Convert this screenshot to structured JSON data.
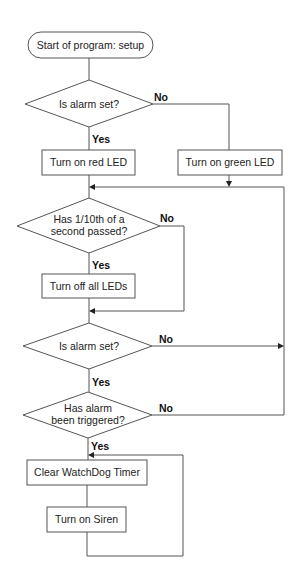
{
  "diagram": {
    "type": "flowchart",
    "colors": {
      "stroke": "#555555",
      "text": "#222222",
      "background": "#ffffff"
    },
    "nodes": {
      "start": {
        "shape": "terminal",
        "label": "Start of program: setup"
      },
      "decision_alarm_set_1": {
        "shape": "decision",
        "label": "Is alarm set?"
      },
      "red_led": {
        "shape": "process",
        "label": "Turn on red LED"
      },
      "green_led": {
        "shape": "process",
        "label": "Turn on green LED"
      },
      "decision_tenth_second": {
        "shape": "decision",
        "line1": "Has 1/10th of a",
        "line2": "second passed?"
      },
      "leds_off": {
        "shape": "process",
        "label": "Turn off all LEDs"
      },
      "decision_alarm_set_2": {
        "shape": "decision",
        "label": "Is alarm set?"
      },
      "decision_triggered": {
        "shape": "decision",
        "line1": "Has alarm",
        "line2": "been triggered?"
      },
      "clear_watchdog": {
        "shape": "process",
        "label": "Clear WatchDog Timer"
      },
      "siren_on": {
        "shape": "process",
        "label": "Turn on Siren"
      }
    },
    "edge_labels": {
      "alarm1_no": "No",
      "alarm1_yes": "Yes",
      "tenth_no": "No",
      "tenth_yes": "Yes",
      "alarm2_no": "No",
      "alarm2_yes": "Yes",
      "triggered_no": "No",
      "triggered_yes": "Yes"
    },
    "edges": [
      {
        "from": "start",
        "to": "decision_alarm_set_1"
      },
      {
        "from": "decision_alarm_set_1",
        "to": "red_led",
        "label": "Yes"
      },
      {
        "from": "decision_alarm_set_1",
        "to": "green_led",
        "label": "No"
      },
      {
        "from": "red_led",
        "to": "decision_tenth_second"
      },
      {
        "from": "green_led",
        "to": "decision_tenth_second"
      },
      {
        "from": "decision_tenth_second",
        "to": "leds_off",
        "label": "Yes"
      },
      {
        "from": "decision_tenth_second",
        "to": "decision_alarm_set_2",
        "label": "No"
      },
      {
        "from": "leds_off",
        "to": "decision_alarm_set_2"
      },
      {
        "from": "decision_alarm_set_2",
        "to": "decision_triggered",
        "label": "Yes"
      },
      {
        "from": "decision_alarm_set_2",
        "to": "decision_tenth_second",
        "label": "No"
      },
      {
        "from": "decision_triggered",
        "to": "clear_watchdog",
        "label": "Yes"
      },
      {
        "from": "decision_triggered",
        "to": "decision_tenth_second",
        "label": "No"
      },
      {
        "from": "clear_watchdog",
        "to": "siren_on"
      },
      {
        "from": "siren_on",
        "to": "clear_watchdog"
      }
    ]
  }
}
